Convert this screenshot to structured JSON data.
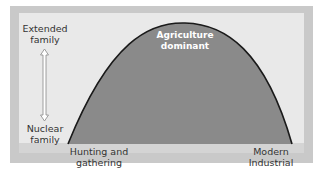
{
  "diagram": {
    "type": "bell-curve",
    "y_axis": {
      "top_label": "Extended family",
      "top_label_lines": [
        "Extended",
        "family"
      ],
      "bottom_label": "Nuclear family",
      "bottom_label_lines": [
        "Nuclear",
        "family"
      ],
      "arrow": "double-headed-vertical"
    },
    "x_axis": {
      "left_label_lines": [
        "Hunting and",
        "gathering"
      ],
      "right_label_lines": [
        "Modern",
        "Industrial"
      ]
    },
    "peak_label_lines": [
      "Agriculture",
      "dominant"
    ],
    "colors": {
      "frame": "#c9c9c9",
      "panel": "#e9e9e9",
      "curve_fill": "#8a8a8a",
      "curve_stroke": "#1a1a1a",
      "peak_text": "#ffffff",
      "label_text": "#333333"
    }
  }
}
